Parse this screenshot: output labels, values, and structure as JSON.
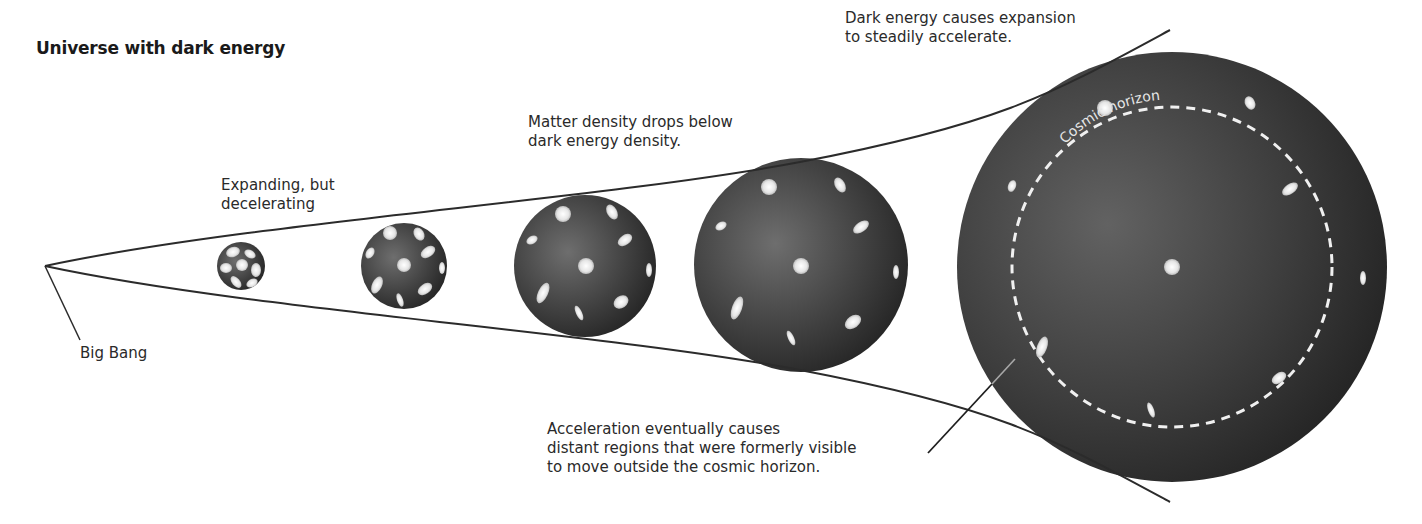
{
  "title": "Universe with dark energy",
  "labels": {
    "big_bang": "Big Bang",
    "decelerating": "Expanding, but\ndecelerating",
    "matter_density": "Matter density drops below\ndark energy density.",
    "dark_energy": "Dark energy causes expansion\nto steadily accelerate.",
    "acceleration": "Acceleration eventually causes\ndistant regions that were formerly visible\nto move outside the cosmic horizon.",
    "cosmic_horizon": "Cosmic horizon"
  },
  "colors": {
    "line": "#2b2b2b",
    "sphere_light": "#6a6a6a",
    "sphere_dark": "#262626",
    "galaxy": "#ececec",
    "horizon": "#f0f0f0"
  },
  "spheres": [
    {
      "id": "stage-1",
      "cx": 241,
      "cy": 266,
      "r": 24
    },
    {
      "id": "stage-2",
      "cx": 404,
      "cy": 266,
      "r": 43
    },
    {
      "id": "stage-3",
      "cx": 585,
      "cy": 266,
      "r": 71
    },
    {
      "id": "stage-4",
      "cx": 801,
      "cy": 265,
      "r": 107
    },
    {
      "id": "stage-5",
      "cx": 1172,
      "cy": 267,
      "r": 215
    }
  ],
  "cosmic_horizon_circle": {
    "cx": 1172,
    "cy": 267,
    "r": 160
  }
}
